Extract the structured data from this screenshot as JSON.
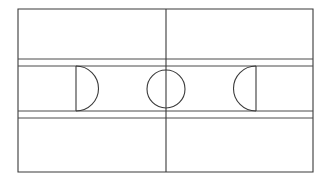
{
  "figure": {
    "kind": "basketball-court-plan",
    "background_color": "#ffffff",
    "line_color": "#3a3a3a",
    "surface_color": "#ffffff"
  },
  "canvas": {
    "width": 331,
    "height": 184
  },
  "court": {
    "boundary": {
      "label": "Court boundary",
      "x": 18,
      "y": 9,
      "width": 295,
      "height": 163
    },
    "center_line": {
      "label": "Center line",
      "x": 166,
      "y1": 9,
      "y2": 172
    },
    "center_circle": {
      "label": "Center circle",
      "cx": 166,
      "cy": 89,
      "r": 19
    },
    "horizontal_lines": [
      {
        "label": "Upper sideline band line",
        "y": 59,
        "x1": 18,
        "x2": 313
      },
      {
        "label": "Upper key line",
        "y": 66,
        "x1": 18,
        "x2": 313
      },
      {
        "label": "Lower key line",
        "y": 111,
        "x1": 18,
        "x2": 313
      },
      {
        "label": "Lower sideline band line",
        "y": 118,
        "x1": 18,
        "x2": 313
      }
    ],
    "left_key": {
      "label": "Left key",
      "x": 18,
      "y": 66,
      "width": 58,
      "height": 45,
      "free_throw_line_x": 76,
      "arc_direction": "right",
      "arc_radius": 22.5
    },
    "right_key": {
      "label": "Right key",
      "x": 256,
      "y": 66,
      "width": 57,
      "height": 45,
      "free_throw_line_x": 256,
      "arc_direction": "left",
      "arc_radius": 22.5
    }
  }
}
